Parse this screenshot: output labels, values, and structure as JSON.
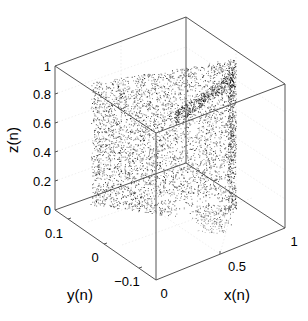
{
  "chart_data": {
    "type": "scatter3d",
    "title": "",
    "xlabel": "x(n)",
    "ylabel": "y(n)",
    "zlabel": "z(n)",
    "xlim": [
      0,
      1
    ],
    "ylim": [
      -0.15,
      0.15
    ],
    "zlim": [
      0,
      1
    ],
    "x_ticks": [
      "0",
      "0.5",
      "1"
    ],
    "y_ticks": [
      "0.1",
      "0",
      "−0.1"
    ],
    "z_ticks": [
      "0",
      "0.2",
      "0.4",
      "0.6",
      "0.8",
      "1"
    ],
    "grid": true,
    "box": true,
    "marker_color": "#000000",
    "point_cloud_extent": {
      "x_range": [
        0.1,
        0.95
      ],
      "z_range": [
        0.15,
        0.92
      ],
      "y_range": [
        -0.1,
        0.1
      ]
    }
  }
}
